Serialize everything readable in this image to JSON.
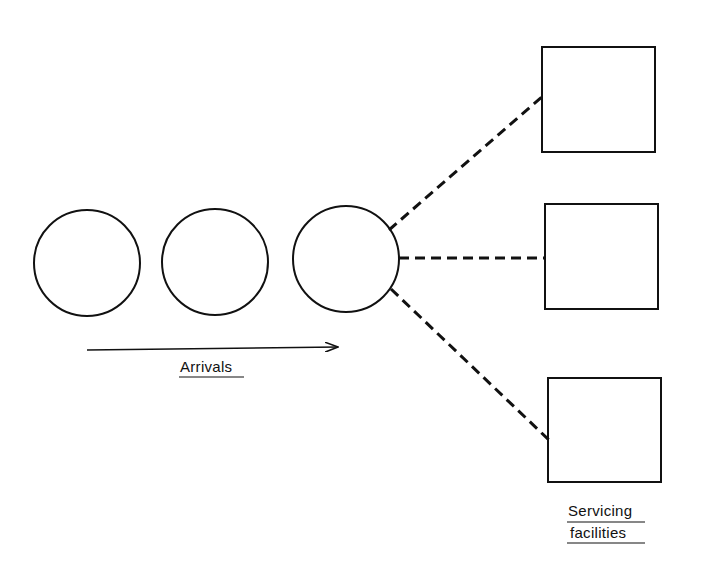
{
  "diagram": {
    "type": "queueing-system",
    "arrivals_label": "Arrivals",
    "servicing_label_line1": "Servicing",
    "servicing_label_line2": "facilities",
    "customers": [
      {
        "id": "customer-1",
        "cx": 87,
        "cy": 263,
        "r": 53
      },
      {
        "id": "customer-2",
        "cx": 215,
        "cy": 262,
        "r": 53
      },
      {
        "id": "customer-3",
        "cx": 346,
        "cy": 259,
        "r": 53
      }
    ],
    "facilities": [
      {
        "id": "facility-1",
        "x": 542,
        "y": 47,
        "w": 113,
        "h": 105
      },
      {
        "id": "facility-2",
        "x": 545,
        "y": 204,
        "w": 113,
        "h": 105
      },
      {
        "id": "facility-3",
        "x": 548,
        "y": 378,
        "w": 113,
        "h": 104
      }
    ],
    "connections": [
      {
        "from": "customer-3",
        "to": "facility-1",
        "style": "dashed"
      },
      {
        "from": "customer-3",
        "to": "facility-2",
        "style": "dashed"
      },
      {
        "from": "customer-3",
        "to": "facility-3",
        "style": "dashed"
      }
    ],
    "colors": {
      "stroke": "#111111",
      "background": "#ffffff"
    }
  }
}
